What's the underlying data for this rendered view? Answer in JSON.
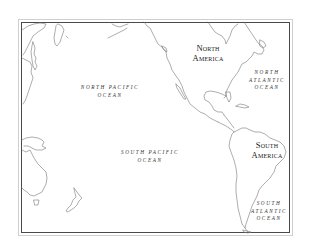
{
  "map": {
    "type": "outline-map",
    "region": "Pacific Ocean and the Americas",
    "colors": {
      "coastline": "#777777",
      "frame": "#4a4a4a",
      "background": "#ffffff",
      "label": "#333333"
    },
    "labels": {
      "north_pacific": {
        "line1": "NORTH PACIFIC",
        "line2": "OCEAN"
      },
      "south_pacific": {
        "line1": "SOUTH PACIFIC",
        "line2": "OCEAN"
      },
      "north_atlantic": {
        "line1": "NORTH",
        "line2": "ATLANTIC",
        "line3": "OCEAN"
      },
      "south_atlantic": {
        "line1": "SOUTH",
        "line2": "ATLANTIC",
        "line3": "OCEAN"
      },
      "north_america": {
        "line1": "North",
        "line2": "America"
      },
      "south_america": {
        "line1": "South",
        "line2": "America"
      }
    }
  }
}
